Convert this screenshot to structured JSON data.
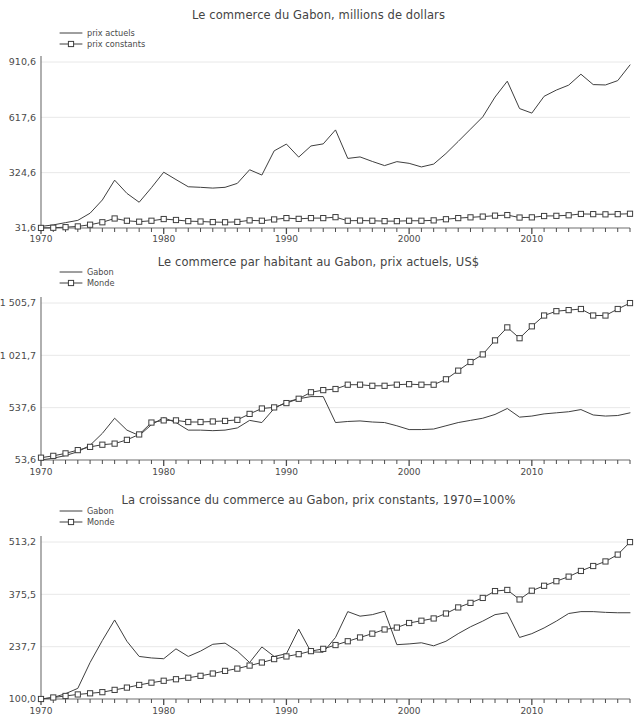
{
  "charts": [
    {
      "id": "chart-1",
      "title": "Le commerce du Gabon, millions de dollars",
      "chart_data": {
        "type": "line",
        "title": "Le commerce du Gabon, millions de dollars",
        "xlabel": "",
        "ylabel": "",
        "grid": true,
        "legend_position": "top-left",
        "xlim": [
          1970,
          2018
        ],
        "ylim": [
          31.6,
          910.6
        ],
        "ytick_labels": [
          "910,6",
          "617,6",
          "324,6",
          "31,6"
        ],
        "ytick_values": [
          910.6,
          617.6,
          324.6,
          31.6
        ],
        "xtick_labels": [
          "1970",
          "1980",
          "1990",
          "2000",
          "2010"
        ],
        "xtick_values": [
          1970,
          1980,
          1990,
          2000,
          2010
        ],
        "x": [
          1970,
          1971,
          1972,
          1973,
          1974,
          1975,
          1976,
          1977,
          1978,
          1979,
          1980,
          1981,
          1982,
          1983,
          1984,
          1985,
          1986,
          1987,
          1988,
          1989,
          1990,
          1991,
          1992,
          1993,
          1994,
          1995,
          1996,
          1997,
          1998,
          1999,
          2000,
          2001,
          2002,
          2003,
          2004,
          2005,
          2006,
          2007,
          2008,
          2009,
          2010,
          2011,
          2012,
          2013,
          2014,
          2015,
          2016,
          2017
        ],
        "series": [
          {
            "name": "prix actuels",
            "marker": "none",
            "values": [
              40,
              48,
              60,
              72,
              110,
              180,
              285,
              215,
              168,
              245,
              327,
              288,
              250,
              247,
              243,
              247,
              268,
              340,
              312,
              440,
              476,
              407,
              466,
              477,
              551,
              400,
              408,
              384,
              362,
              383,
              374,
              355,
              370,
              426,
              490,
              555,
              620,
              725,
              809,
              664,
              640,
              729,
              762,
              788,
              846,
              791,
              789,
              812,
              895
            ]
          },
          {
            "name": "prix constants",
            "marker": "square",
            "values": [
              32,
              33,
              36,
              40,
              49,
              62,
              82,
              70,
              65,
              70,
              79,
              74,
              68,
              66,
              63,
              62,
              64,
              72,
              70,
              77,
              84,
              80,
              84,
              84,
              89,
              70,
              71,
              70,
              68,
              68,
              70,
              70,
              72,
              78,
              84,
              88,
              92,
              97,
              100,
              87,
              88,
              95,
              96,
              99,
              106,
              105,
              104,
              105,
              107
            ]
          }
        ]
      },
      "legend": [
        {
          "label": "prix actuels",
          "marker": "none"
        },
        {
          "label": "prix constants",
          "marker": "square"
        }
      ]
    },
    {
      "id": "chart-2",
      "title": "Le commerce par habitant au Gabon, prix actuels, US$",
      "chart_data": {
        "type": "line",
        "title": "Le commerce par habitant au Gabon, prix actuels, US$",
        "xlabel": "",
        "ylabel": "",
        "grid": true,
        "legend_position": "top-left",
        "xlim": [
          1970,
          2018
        ],
        "ylim": [
          53.6,
          1505.7
        ],
        "ytick_labels": [
          "1 505,7",
          "1 021,7",
          "537,6",
          "53,6"
        ],
        "ytick_values": [
          1505.7,
          1021.7,
          537.6,
          53.6
        ],
        "xtick_labels": [
          "1970",
          "1980",
          "1990",
          "2000",
          "2010"
        ],
        "xtick_values": [
          1970,
          1980,
          1990,
          2000,
          2010
        ],
        "x": [
          1970,
          1971,
          1972,
          1973,
          1974,
          1975,
          1976,
          1977,
          1978,
          1979,
          1980,
          1981,
          1982,
          1983,
          1984,
          1985,
          1986,
          1987,
          1988,
          1989,
          1990,
          1991,
          1992,
          1993,
          1994,
          1995,
          1996,
          1997,
          1998,
          1999,
          2000,
          2001,
          2002,
          2003,
          2004,
          2005,
          2006,
          2007,
          2008,
          2009,
          2010,
          2011,
          2012,
          2013,
          2014,
          2015,
          2016,
          2017
        ],
        "series": [
          {
            "name": "Gabon",
            "marker": "none",
            "values": [
              54,
              70,
              95,
              130,
              190,
              300,
              440,
              330,
              280,
              380,
              445,
              400,
              330,
              330,
              325,
              330,
              350,
              420,
              400,
              530,
              590,
              620,
              640,
              640,
              400,
              410,
              415,
              405,
              400,
              370,
              335,
              335,
              340,
              370,
              400,
              420,
              440,
              475,
              530,
              450,
              460,
              480,
              490,
              500,
              520,
              470,
              460,
              465,
              490
            ]
          },
          {
            "name": "Monde",
            "marker": "square",
            "values": [
              75,
              92,
              115,
              145,
              175,
              195,
              205,
              240,
              290,
              400,
              420,
              420,
              405,
              405,
              410,
              415,
              425,
              480,
              530,
              540,
              580,
              620,
              680,
              700,
              710,
              750,
              750,
              740,
              740,
              750,
              755,
              750,
              750,
              800,
              880,
              960,
              1030,
              1160,
              1280,
              1180,
              1290,
              1390,
              1430,
              1440,
              1450,
              1390,
              1390,
              1450,
              1505
            ]
          }
        ]
      },
      "legend": [
        {
          "label": "Gabon",
          "marker": "none"
        },
        {
          "label": "Monde",
          "marker": "square"
        }
      ]
    },
    {
      "id": "chart-3",
      "title": "La croissance du commerce au Gabon, prix constants, 1970=100%",
      "chart_data": {
        "type": "line",
        "title": "La croissance du commerce au Gabon, prix constants, 1970=100%",
        "xlabel": "",
        "ylabel": "",
        "grid": true,
        "legend_position": "top-left",
        "xlim": [
          1970,
          2018
        ],
        "ylim": [
          100.0,
          513.2
        ],
        "ytick_labels": [
          "513,2",
          "375,5",
          "237,7",
          "100,0"
        ],
        "ytick_values": [
          513.2,
          375.5,
          237.7,
          100.0
        ],
        "xtick_labels": [
          "1970",
          "1980",
          "1990",
          "2000",
          "2010"
        ],
        "xtick_values": [
          1970,
          1980,
          1990,
          2000,
          2010
        ],
        "x": [
          1970,
          1971,
          1972,
          1973,
          1974,
          1975,
          1976,
          1977,
          1978,
          1979,
          1980,
          1981,
          1982,
          1983,
          1984,
          1985,
          1986,
          1987,
          1988,
          1989,
          1990,
          1991,
          1992,
          1993,
          1994,
          1995,
          1996,
          1997,
          1998,
          1999,
          2000,
          2001,
          2002,
          2003,
          2004,
          2005,
          2006,
          2007,
          2008,
          2009,
          2010,
          2011,
          2012,
          2013,
          2014,
          2015,
          2016,
          2017
        ],
        "series": [
          {
            "name": "Gabon",
            "marker": "none",
            "values": [
              100,
              104,
              114,
              128,
              196,
              254,
              308,
              252,
              212,
              208,
              206,
              232,
              212,
              226,
              244,
              247,
              226,
              196,
              237,
              212,
              219,
              284,
              224,
              223,
              262,
              330,
              318,
              322,
              331,
              243,
              245,
              248,
              240,
              252,
              272,
              290,
              305,
              322,
              327,
              262,
              272,
              287,
              305,
              325,
              330,
              330,
              328,
              327,
              327
            ]
          },
          {
            "name": "Monde",
            "marker": "square",
            "values": [
              100,
              104,
              108,
              112,
              115,
              118,
              124,
              130,
              137,
              143,
              148,
              152,
              156,
              161,
              167,
              174,
              180,
              188,
              196,
              205,
              212,
              218,
              226,
              232,
              242,
              252,
              262,
              272,
              283,
              288,
              300,
              306,
              312,
              325,
              341,
              353,
              366,
              384,
              387,
              362,
              385,
              398,
              410,
              422,
              437,
              450,
              462,
              480,
              513
            ]
          }
        ]
      },
      "legend": [
        {
          "label": "Gabon",
          "marker": "none"
        },
        {
          "label": "Monde",
          "marker": "square"
        }
      ]
    }
  ],
  "colors": {
    "line": "#3f3f3f",
    "grid": "#e8e8e8",
    "axis": "#6e6e6e",
    "text": "#4a4a4a",
    "background": "#ffffff"
  }
}
